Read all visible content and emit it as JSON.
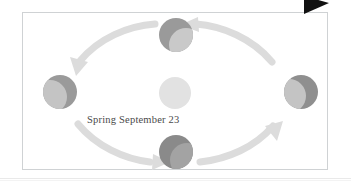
{
  "figure": {
    "type": "orbital-seasons-diagram",
    "frame_border_color": "#cfd2d4",
    "background_color": "#ffffff",
    "corner_marker": {
      "icon": "black-right-triangle-marker",
      "color": "#111111"
    }
  },
  "label": {
    "text": "Spring September 23",
    "color": "#4a4a4a"
  },
  "sun": {
    "name": "sun",
    "color": "#e2e2e2",
    "cx": 175,
    "cy": 93,
    "r": 16
  },
  "planets": [
    {
      "name": "planet-top",
      "position": "top",
      "cx": 176,
      "cy": 35,
      "r": 17,
      "dark_color": "#9a9a9a",
      "light_color": "#c9c9c9",
      "lit_side": "lower-left"
    },
    {
      "name": "planet-left",
      "position": "left",
      "cx": 60,
      "cy": 92,
      "r": 17,
      "dark_color": "#9a9a9a",
      "light_color": "#c4c4c4",
      "lit_side": "left"
    },
    {
      "name": "planet-right",
      "position": "right",
      "cx": 301,
      "cy": 92,
      "r": 17,
      "dark_color": "#8f8f8f",
      "light_color": "#c4c4c4",
      "lit_side": "left-crescent"
    },
    {
      "name": "planet-bottom",
      "position": "bottom",
      "cx": 176,
      "cy": 152,
      "r": 17,
      "dark_color": "#8a8a8a",
      "light_color": "#a3a3a3",
      "lit_side": "lower-right"
    }
  ],
  "arrows": [
    {
      "name": "orbit-arrow-top-left",
      "direction": "counterclockwise",
      "points_to": "left",
      "color": "#dcdcdc"
    },
    {
      "name": "orbit-arrow-top-right",
      "direction": "counterclockwise",
      "points_to": "planet-top",
      "color": "#dcdcdc"
    },
    {
      "name": "orbit-arrow-bottom-left",
      "direction": "counterclockwise",
      "points_to": "planet-bottom",
      "color": "#dcdcdc"
    },
    {
      "name": "orbit-arrow-bottom-right",
      "direction": "counterclockwise",
      "points_to": "planet-right",
      "color": "#dcdcdc"
    }
  ]
}
